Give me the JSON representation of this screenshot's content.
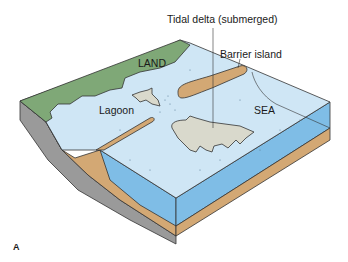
{
  "figure": {
    "panel_label": "A",
    "labels": {
      "tidal_delta": "Tidal delta (submerged)",
      "barrier_island": "Barrier island",
      "land": "LAND",
      "lagoon": "Lagoon",
      "sea": "SEA"
    },
    "colors": {
      "land": "#7fa877",
      "water_surface": "#cfe6f5",
      "water_side": "#7fbde6",
      "sand": "#d3a874",
      "tidal_delta": "#d9d9cc",
      "bedrock": "#9a9a9a",
      "outline": "#333333"
    }
  }
}
